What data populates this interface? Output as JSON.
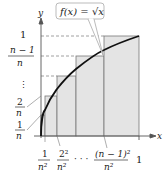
{
  "diagram": {
    "function_label": "f(x) = √x",
    "axes": {
      "x_label": "x",
      "y_label": "y"
    },
    "y_ticks": [
      {
        "num": "1",
        "den": "n"
      },
      {
        "num": "2",
        "den": "n"
      },
      {
        "dots": "⋮"
      },
      {
        "num": "n − 1",
        "den": "n"
      },
      {
        "value": "1"
      }
    ],
    "x_ticks": [
      {
        "num": "1",
        "den": "n²"
      },
      {
        "num": "2²",
        "den": "n²"
      },
      {
        "dots": "· · ·"
      },
      {
        "num": "(n − 1)²",
        "den": "n²"
      },
      {
        "value": "1"
      }
    ],
    "colors": {
      "fill": "#e6e6e6",
      "curve": "#111111",
      "line": "#666666"
    }
  }
}
